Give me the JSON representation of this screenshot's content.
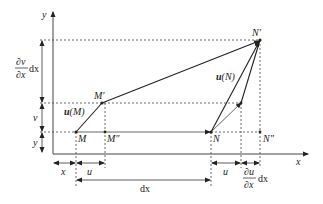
{
  "figure": {
    "type": "deformation-of-line-element",
    "axes": {
      "x_label": "x",
      "y_label": "y"
    },
    "points": {
      "M": "M",
      "M_prime": "M′",
      "M_double_prime": "M″",
      "N": "N",
      "N_prime": "N′",
      "N_double_prime": "N″"
    },
    "vectors": {
      "uM": {
        "bold": "u",
        "arg": "(M)"
      },
      "uN": {
        "bold": "u",
        "arg": "(N)"
      }
    },
    "left_dimensions": {
      "dv_dx_dx": {
        "num": "∂v",
        "den": "∂x",
        "suffix": "dx"
      },
      "v": "v",
      "y": "y"
    },
    "bottom_dimensions": {
      "x": "x",
      "u1": "u",
      "dx": "dx",
      "u2": "u",
      "du_dx_dx": {
        "num": "∂u",
        "den": "∂x",
        "suffix": "dx"
      }
    }
  }
}
